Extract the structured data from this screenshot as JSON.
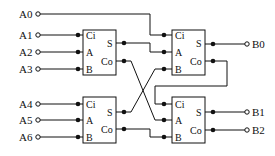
{
  "diagram": {
    "title": "",
    "inputs": [
      "A0",
      "A1",
      "A2",
      "A3",
      "A4",
      "A5",
      "A6"
    ],
    "outputs": [
      "B0",
      "B1",
      "B2"
    ],
    "blocks": [
      {
        "id": "fa1",
        "pins_in": [
          "Ci",
          "A",
          "B"
        ],
        "pins_out": [
          "S",
          "Co"
        ]
      },
      {
        "id": "fa2",
        "pins_in": [
          "Ci",
          "A",
          "B"
        ],
        "pins_out": [
          "S",
          "Co"
        ]
      },
      {
        "id": "fa3",
        "pins_in": [
          "Ci",
          "A",
          "B"
        ],
        "pins_out": [
          "S",
          "Co"
        ]
      },
      {
        "id": "fa4",
        "pins_in": [
          "Ci",
          "A",
          "B"
        ],
        "pins_out": [
          "S",
          "Co"
        ]
      }
    ],
    "connections": [
      {
        "from": "A0",
        "to": "fa2.Ci"
      },
      {
        "from": "A1",
        "to": "fa1.Ci"
      },
      {
        "from": "A2",
        "to": "fa1.A"
      },
      {
        "from": "A3",
        "to": "fa1.B"
      },
      {
        "from": "A4",
        "to": "fa3.Ci"
      },
      {
        "from": "A5",
        "to": "fa3.A"
      },
      {
        "from": "A6",
        "to": "fa3.B"
      },
      {
        "from": "fa1.S",
        "to": "fa2.A"
      },
      {
        "from": "fa1.Co",
        "to": "fa4.A"
      },
      {
        "from": "fa3.S",
        "to": "fa2.B"
      },
      {
        "from": "fa3.Co",
        "to": "fa4.B"
      },
      {
        "from": "fa2.S",
        "to": "B0"
      },
      {
        "from": "fa2.Co",
        "to": "fa4.Ci"
      },
      {
        "from": "fa4.S",
        "to": "B1"
      },
      {
        "from": "fa4.Co",
        "to": "B2"
      }
    ]
  }
}
